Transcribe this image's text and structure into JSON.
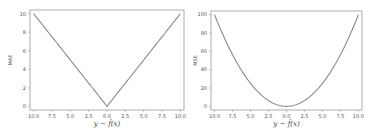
{
  "chart_data": [
    {
      "type": "line",
      "title": "",
      "xlabel": "y − f̂(x)",
      "ylabel": "MAE",
      "xlim": [
        -10.5,
        10.5
      ],
      "ylim": [
        -0.4,
        10.4
      ],
      "xticks": [
        -10,
        -7.5,
        -5,
        -2.5,
        0,
        2.5,
        5,
        7.5,
        10
      ],
      "xtick_labels": [
        "10.0",
        "7.5",
        "5.0",
        "2.5",
        "0.0",
        "2.5",
        "5.0",
        "7.5",
        "10.0"
      ],
      "yticks": [
        0,
        2,
        4,
        6,
        8,
        10
      ],
      "ytick_labels": [
        "0",
        "2",
        "4",
        "6",
        "8",
        "10"
      ],
      "grid": false,
      "series": [
        {
          "name": "MAE",
          "function": "abs",
          "x": [
            -10,
            -7.5,
            -5,
            -2.5,
            0,
            2.5,
            5,
            7.5,
            10
          ],
          "values": [
            10,
            7.5,
            5,
            2.5,
            0,
            2.5,
            5,
            7.5,
            10
          ]
        }
      ]
    },
    {
      "type": "line",
      "title": "",
      "xlabel": "y − f̂(x)",
      "ylabel": "MSE",
      "xlim": [
        -10.5,
        10.5
      ],
      "ylim": [
        -4,
        104
      ],
      "xticks": [
        -10,
        -7.5,
        -5,
        -2.5,
        0,
        2.5,
        5,
        7.5,
        10
      ],
      "xtick_labels": [
        "10.0",
        "7.5",
        "5.0",
        "2.5",
        "0.0",
        "2.5",
        "5.0",
        "7.5",
        "10.0"
      ],
      "yticks": [
        0,
        20,
        40,
        60,
        80,
        100
      ],
      "ytick_labels": [
        "0",
        "20",
        "40",
        "60",
        "80",
        "100"
      ],
      "grid": false,
      "series": [
        {
          "name": "MSE",
          "function": "square",
          "x": [
            -10,
            -7.5,
            -5,
            -2.5,
            0,
            2.5,
            5,
            7.5,
            10
          ],
          "values": [
            100,
            56.25,
            25,
            6.25,
            0,
            6.25,
            25,
            56.25,
            100
          ]
        }
      ]
    }
  ]
}
